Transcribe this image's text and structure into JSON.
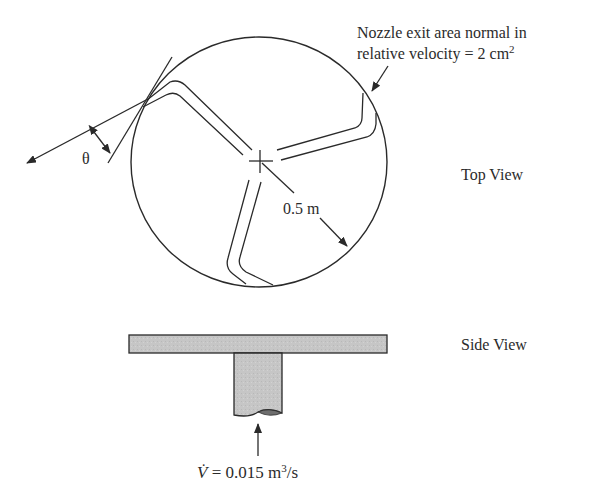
{
  "figure": {
    "type": "sprinkler-turbine-schematic",
    "colors": {
      "stroke": "#2a2a2a",
      "fill": "#c4c4c4",
      "background": "#ffffff"
    }
  },
  "labels": {
    "nozzle_line1": "Nozzle exit area normal in",
    "nozzle_line2_prefix": "relative velocity = 2 cm",
    "nozzle_line2_sup": "2",
    "theta": "θ",
    "radius": "0.5 m",
    "top_view": "Top View",
    "side_view": "Side View",
    "flow_symbol": "V̇",
    "flow_eq": " = 0.015 m",
    "flow_sup": "3",
    "flow_unit": "/s"
  }
}
